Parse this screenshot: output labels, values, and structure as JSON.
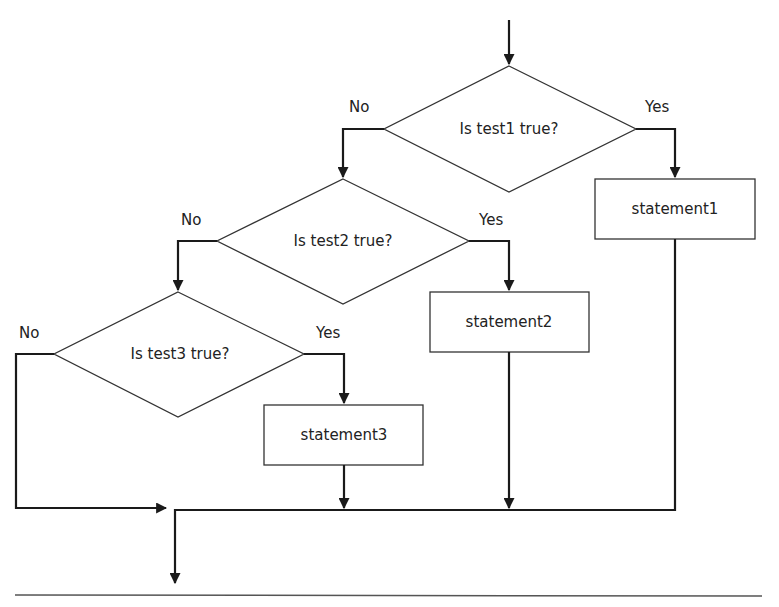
{
  "diagram": {
    "type": "flowchart",
    "title": "",
    "decisions": [
      {
        "id": "d1",
        "label": "Is test1 true?",
        "no_label": "No",
        "yes_label": "Yes"
      },
      {
        "id": "d2",
        "label": "Is test2 true?",
        "no_label": "No",
        "yes_label": "Yes"
      },
      {
        "id": "d3",
        "label": "Is test3 true?",
        "no_label": "No",
        "yes_label": "Yes"
      }
    ],
    "statements": [
      {
        "id": "s1",
        "label": "statement1"
      },
      {
        "id": "s2",
        "label": "statement2"
      },
      {
        "id": "s3",
        "label": "statement3"
      }
    ],
    "edges": [
      {
        "from": "start",
        "to": "d1"
      },
      {
        "from": "d1",
        "to": "s1",
        "label": "Yes"
      },
      {
        "from": "d1",
        "to": "d2",
        "label": "No"
      },
      {
        "from": "d2",
        "to": "s2",
        "label": "Yes"
      },
      {
        "from": "d2",
        "to": "d3",
        "label": "No"
      },
      {
        "from": "d3",
        "to": "s3",
        "label": "Yes"
      },
      {
        "from": "d3",
        "to": "join",
        "label": "No"
      },
      {
        "from": "s1",
        "to": "join"
      },
      {
        "from": "s2",
        "to": "join"
      },
      {
        "from": "s3",
        "to": "join"
      },
      {
        "from": "join",
        "to": "end"
      }
    ],
    "colors": {
      "stroke": "#1a1a1a",
      "text": "#222222",
      "background": "#ffffff"
    }
  }
}
